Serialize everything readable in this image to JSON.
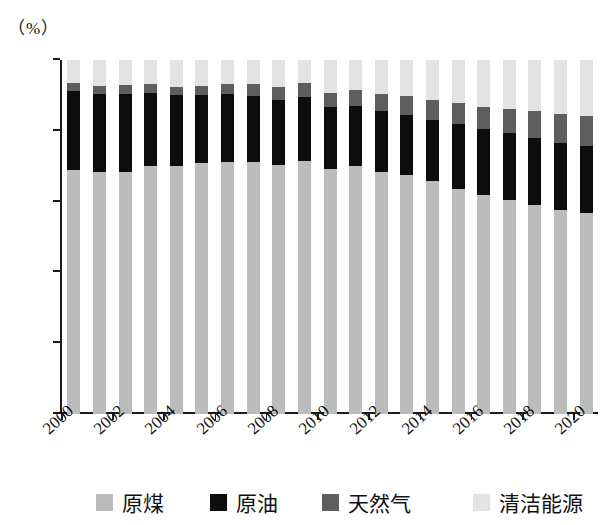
{
  "axis": {
    "unit_label": "（%）",
    "y_ticks": [
      0,
      20,
      40,
      60,
      80,
      100
    ],
    "y_min": 0,
    "y_max": 100
  },
  "legend": {
    "items": [
      {
        "label": "原煤",
        "color": "#bcbcbc",
        "key": "coal"
      },
      {
        "label": "原油",
        "color": "#0d0d0d",
        "key": "oil"
      },
      {
        "label": "天然气",
        "color": "#5e5e5e",
        "key": "gas"
      },
      {
        "label": "清洁能源",
        "color": "#e3e3e3",
        "key": "clean"
      }
    ]
  },
  "chart_data": {
    "type": "bar",
    "stacked": true,
    "title": "",
    "xlabel": "",
    "ylabel": "（%）",
    "ylim": [
      0,
      100
    ],
    "grid": false,
    "legend_position": "bottom",
    "categories": [
      "2000",
      "2001",
      "2002",
      "2003",
      "2004",
      "2005",
      "2006",
      "2007",
      "2008",
      "2009",
      "2010",
      "2011",
      "2012",
      "2013",
      "2014",
      "2015",
      "2016",
      "2017",
      "2018",
      "2019",
      "2020"
    ],
    "tick_labels_shown": [
      "2000",
      "2002",
      "2004",
      "2006",
      "2008",
      "2010",
      "2012",
      "2014",
      "2016",
      "2018",
      "2020"
    ],
    "series": [
      {
        "name": "原煤",
        "color": "#bcbcbc",
        "values": [
          69.0,
          68.5,
          68.5,
          70.2,
          70.2,
          70.8,
          71.1,
          71.1,
          70.3,
          71.6,
          69.2,
          70.2,
          68.5,
          67.4,
          65.8,
          63.7,
          62.0,
          60.4,
          59.0,
          57.7,
          56.8
        ]
      },
      {
        "name": "原油",
        "color": "#0d0d0d",
        "values": [
          22.2,
          21.8,
          22.0,
          20.5,
          19.8,
          19.4,
          19.3,
          18.8,
          18.3,
          17.9,
          17.4,
          16.8,
          17.0,
          17.1,
          17.3,
          18.3,
          18.4,
          18.9,
          18.9,
          19.0,
          18.9
        ]
      },
      {
        "name": "天然气",
        "color": "#5e5e5e",
        "values": [
          2.2,
          2.4,
          2.4,
          2.5,
          2.5,
          2.6,
          2.9,
          3.3,
          3.7,
          3.9,
          4.0,
          4.6,
          4.8,
          5.3,
          5.7,
          5.9,
          6.2,
          6.9,
          7.6,
          8.1,
          8.5
        ]
      },
      {
        "name": "清洁能源",
        "color": "#e3e3e3",
        "values": [
          6.6,
          7.3,
          7.1,
          6.8,
          7.5,
          7.2,
          6.7,
          6.8,
          7.7,
          6.6,
          9.4,
          8.4,
          9.7,
          10.2,
          11.2,
          12.1,
          13.4,
          13.8,
          14.5,
          15.2,
          15.8
        ]
      }
    ]
  }
}
